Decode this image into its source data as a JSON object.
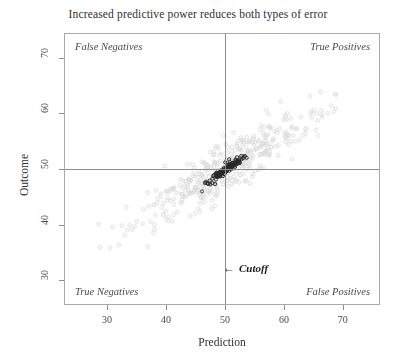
{
  "chart_data": {
    "type": "scatter",
    "title": "Increased predictive power reduces both types of error",
    "xlabel": "Prediction",
    "ylabel": "Outcome",
    "xlim": [
      22.7,
      76.3
    ],
    "ylim": [
      25.6,
      74.4
    ],
    "xticks": [
      30,
      40,
      50,
      60,
      70
    ],
    "yticks": [
      30,
      40,
      50,
      60,
      70
    ],
    "grid": false,
    "legend": null,
    "annotations": {
      "quadrant_top_left": "False Negatives",
      "quadrant_top_right": "True Positives",
      "quadrant_bottom_left": "True Negatives",
      "quadrant_bottom_right": "False Positives",
      "cutoff_arrow": "←",
      "cutoff_label": "Cutoff"
    },
    "reference_lines": {
      "vertical_cutoff_x": 50,
      "horizontal_cutoff_y": 50,
      "color": "#8d8d8d"
    },
    "series": [
      {
        "name": "low-predictive-power",
        "marker": "open-circle",
        "color": "#d9d9d9",
        "size": 3.6,
        "n": 420,
        "mean_x": 50,
        "mean_y": 50,
        "sd_x": 7.2,
        "sd_y": 5.2,
        "correlation": 0.9,
        "seed": 8831
      },
      {
        "name": "high-predictive-power",
        "marker": "open-circle",
        "color": "#262626",
        "size": 3.2,
        "n": 118,
        "mean_x": 50.2,
        "mean_y": 50.0,
        "sd_x": 1.55,
        "sd_y": 1.25,
        "correlation": 0.93,
        "seed": 4417
      }
    ]
  }
}
